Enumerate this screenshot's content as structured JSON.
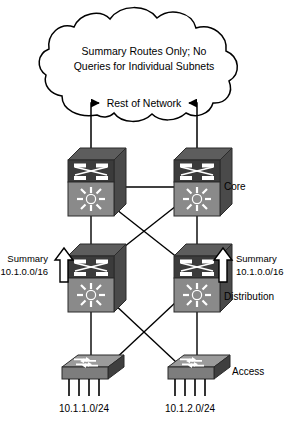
{
  "diagram": {
    "cloud": {
      "name": "network-cloud",
      "line1": "Summary Routes Only; No",
      "line2": "Queries for Individual Subnets",
      "rest_of_network_label": "Rest of Network"
    },
    "tiers": {
      "core_label": "Core",
      "distribution_label": "Distribution",
      "access_label": "Access"
    },
    "summary_annotations": [
      {
        "name": "summary-left",
        "line1": "Summary",
        "line2": "10.1.0.0/16",
        "arrow": "up-arrow-icon"
      },
      {
        "name": "summary-right",
        "line1": "Summary",
        "line2": "10.1.0.0/16",
        "arrow": "up-arrow-icon"
      }
    ],
    "subnets": [
      {
        "name": "subnet-left",
        "label": "10.1.1.0/24"
      },
      {
        "name": "subnet-right",
        "label": "10.1.2.0/24"
      }
    ],
    "devices": [
      {
        "name": "core-switch-left",
        "type": "multilayer-switch",
        "tier": "core"
      },
      {
        "name": "core-switch-right",
        "type": "multilayer-switch",
        "tier": "core"
      },
      {
        "name": "distribution-switch-left",
        "type": "multilayer-switch",
        "tier": "distribution"
      },
      {
        "name": "distribution-switch-right",
        "type": "multilayer-switch",
        "tier": "distribution"
      },
      {
        "name": "access-switch-left",
        "type": "workgroup-switch",
        "tier": "access"
      },
      {
        "name": "access-switch-right",
        "type": "workgroup-switch",
        "tier": "access"
      }
    ],
    "colors": {
      "line": "#000000",
      "cloud_fill": "#ffffff",
      "device_dark": "#3a3a3a",
      "device_mid": "#6e6e6e",
      "device_light": "#9a9a9a",
      "device_top": "#8d8d8d",
      "arrow_fill": "#ffffff",
      "background": "#ffffff"
    }
  }
}
